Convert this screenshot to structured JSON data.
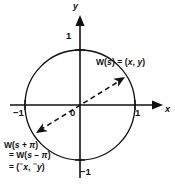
{
  "figure": {
    "background_color": "#ffffff",
    "ink_color": "#111111"
  },
  "axes": {
    "x_axis_label": "x",
    "y_axis_label": "y",
    "origin_label": "0",
    "ticks": {
      "top": "1",
      "bottom": "−1",
      "left": "−1",
      "right": "1"
    }
  },
  "circle": {
    "center_x": 80,
    "center_y": 105,
    "radius": 55,
    "stroke_color": "#111111",
    "stroke_width": 1.3,
    "fill": "none"
  },
  "secant": {
    "style": "dashed",
    "dash_pattern": "5 3.5",
    "stroke_color": "#111111",
    "stroke_width": 1.5,
    "arrowheads": [
      "start",
      "end"
    ]
  },
  "points": {
    "w_s": {
      "label": "W(s) = (x, y)",
      "label_parts": {
        "prefix": "W(",
        "arg": "s",
        "middle": ") = (",
        "x": "x",
        "comma": ", ",
        "y": "y",
        "suffix": ")"
      },
      "px": 125,
      "py": 77,
      "marker": "arrowhead"
    },
    "w_s_plus_pi": {
      "label_lines": [
        "W(s + π)",
        "= W(s − π)",
        "= (⁻x, ⁻y)"
      ],
      "line1_parts": {
        "prefix": "W(",
        "arg": "s",
        "op": " + ",
        "sym": "π",
        "suffix": ")"
      },
      "line2_parts": {
        "eq": "= W(",
        "arg": "s",
        "op": " − ",
        "sym": "π",
        "suffix": ")"
      },
      "line3_parts": {
        "eq": "= (",
        "minus": "⁻",
        "x": "x",
        "comma": ", ",
        "minus2": "⁻",
        "y": "y",
        "suffix": ")"
      },
      "px": 36,
      "py": 133,
      "marker": "arrowhead"
    }
  }
}
